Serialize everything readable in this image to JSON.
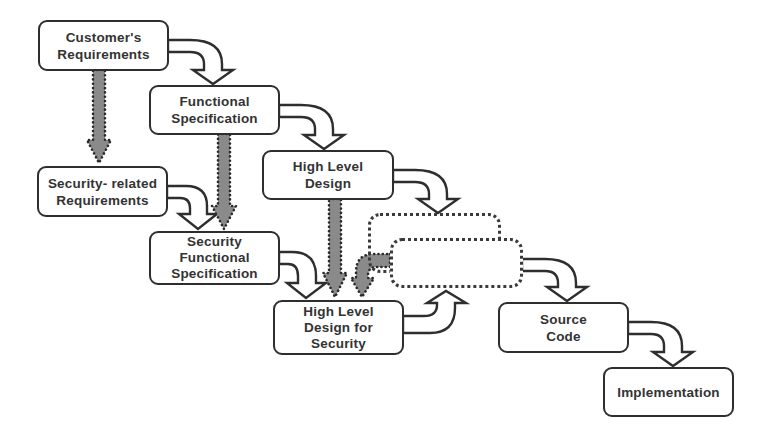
{
  "diagram": {
    "type": "security-waterfall-development-flow",
    "colors": {
      "box_border": "#2e2e2e",
      "box_text": "#333333",
      "flow_arrow_outline": "#2e2e2e",
      "security_arrow_fill": "#8a8a8a",
      "security_arrow_dots": "#2a2a2a",
      "background": "#ffffff"
    },
    "nodes": [
      {
        "id": "customers-requirements",
        "lines": [
          "Customer's",
          "Requirements"
        ]
      },
      {
        "id": "functional-specification",
        "lines": [
          "Functional",
          "Specification"
        ]
      },
      {
        "id": "high-level-design",
        "lines": [
          "High Level",
          "Design"
        ]
      },
      {
        "id": "security-related-requirements",
        "lines": [
          "Security- related",
          "Requirements"
        ]
      },
      {
        "id": "security-functional-specification",
        "lines": [
          "Security",
          "Functional",
          "Specification"
        ]
      },
      {
        "id": "high-level-design-for-security",
        "lines": [
          "High Level",
          "Design for",
          "Security"
        ]
      },
      {
        "id": "source-code",
        "lines": [
          "Source",
          "Code"
        ]
      },
      {
        "id": "implementation",
        "lines": [
          "Implementation"
        ]
      }
    ],
    "placeholder_nodes": [
      {
        "id": "unlabeled-dotted-box-back",
        "style": "dotted"
      },
      {
        "id": "unlabeled-dotted-box-front",
        "style": "dotted"
      }
    ],
    "edges": [
      {
        "from": "customers-requirements",
        "to": "functional-specification",
        "style": "curved-hollow"
      },
      {
        "from": "functional-specification",
        "to": "high-level-design",
        "style": "curved-hollow"
      },
      {
        "from": "high-level-design",
        "to": "unlabeled-dotted-box-back",
        "style": "curved-hollow"
      },
      {
        "from": "security-related-requirements",
        "to": "security-functional-specification",
        "style": "curved-hollow"
      },
      {
        "from": "security-functional-specification",
        "to": "high-level-design-for-security",
        "style": "curved-hollow"
      },
      {
        "from": "high-level-design-for-security",
        "to": "unlabeled-dotted-box-front",
        "style": "curved-hollow-up"
      },
      {
        "from": "unlabeled-dotted-box-front",
        "to": "source-code",
        "style": "curved-hollow"
      },
      {
        "from": "source-code",
        "to": "implementation",
        "style": "curved-hollow"
      },
      {
        "from": "customers-requirements",
        "to": "security-related-requirements",
        "style": "gray-dotted-down"
      },
      {
        "from": "functional-specification",
        "to": "security-functional-specification",
        "style": "gray-dotted-down"
      },
      {
        "from": "high-level-design",
        "to": "high-level-design-for-security",
        "style": "gray-dotted-down"
      },
      {
        "from": "unlabeled-dotted-box-front",
        "to": "high-level-design-for-security",
        "style": "gray-dotted-curved"
      }
    ]
  }
}
